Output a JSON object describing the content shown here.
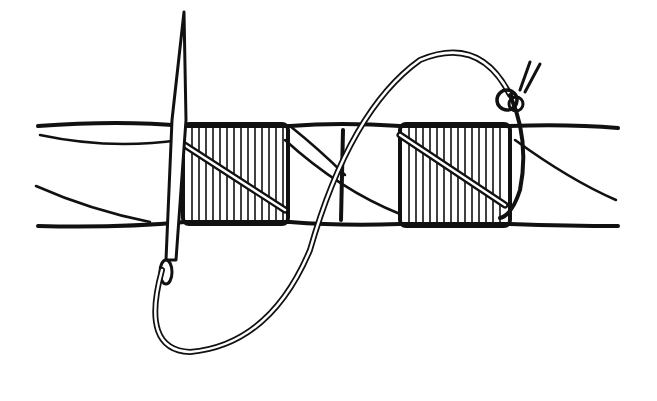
{
  "illustration": {
    "subject": "needle whipping thread around twisted rope",
    "colors": {
      "ink": "#111111",
      "background": "#ffffff"
    }
  }
}
